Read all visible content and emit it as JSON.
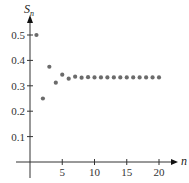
{
  "chart_data": {
    "type": "scatter",
    "title": "",
    "xlabel": "n",
    "ylabel": "S_n",
    "ylabel_main": "S",
    "ylabel_sub": "n",
    "xlim": [
      0,
      21
    ],
    "ylim": [
      0,
      0.55
    ],
    "grid": false,
    "legend": null,
    "x_ticks": [
      5,
      10,
      15,
      20
    ],
    "x_tick_labels": [
      "5",
      "10",
      "15",
      "20"
    ],
    "y_ticks": [
      0.1,
      0.2,
      0.3,
      0.4,
      0.5
    ],
    "y_tick_labels": [
      "0.1",
      "0.2",
      "0.3",
      "0.4",
      "0.5"
    ],
    "x": [
      1,
      2,
      3,
      4,
      5,
      6,
      7,
      8,
      9,
      10,
      11,
      12,
      13,
      14,
      15,
      16,
      17,
      18,
      19,
      20
    ],
    "values": [
      0.5,
      0.25,
      0.375,
      0.3125,
      0.34375,
      0.328,
      0.336,
      0.332,
      0.334,
      0.333,
      0.333,
      0.333,
      0.333,
      0.333,
      0.333,
      0.333,
      0.333,
      0.333,
      0.333,
      0.333
    ],
    "point_color": "#6b6b6b",
    "axis_color": "#333333"
  }
}
